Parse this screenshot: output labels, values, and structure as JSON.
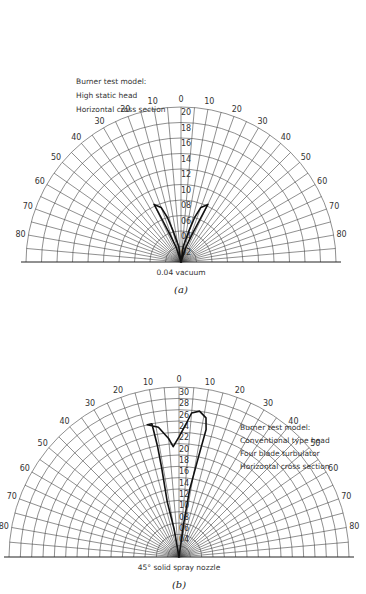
{
  "chart_data": [
    {
      "type": "polar",
      "panel": "(a)",
      "caption": "(a)",
      "annotation": [
        "Burner test model:",
        "High static head",
        "Horizontal cross section"
      ],
      "bottom_label": "0.04 vacuum",
      "angle_ticks_deg": [
        0,
        10,
        20,
        30,
        40,
        50,
        60,
        70,
        80
      ],
      "radial_ticks": [
        "0.2",
        "0.4",
        "0.6",
        "0.8",
        "1.0",
        "1.2",
        "1.4",
        "1.6",
        "1.8",
        "2.0"
      ],
      "rmax": 2.0,
      "series": [
        {
          "name": "left lobe",
          "points": [
            [
              0,
              0
            ],
            [
              -8,
              0.2
            ],
            [
              -14,
              0.4
            ],
            [
              -17,
              0.6
            ],
            [
              -20,
              0.75
            ],
            [
              -25,
              0.82
            ],
            [
              -24,
              0.6
            ],
            [
              -22,
              0.4
            ],
            [
              -18,
              0.2
            ],
            [
              0,
              0
            ]
          ]
        },
        {
          "name": "right lobe",
          "points": [
            [
              0,
              0
            ],
            [
              8,
              0.2
            ],
            [
              14,
              0.4
            ],
            [
              17,
              0.6
            ],
            [
              20,
              0.75
            ],
            [
              25,
              0.82
            ],
            [
              24,
              0.6
            ],
            [
              22,
              0.4
            ],
            [
              18,
              0.2
            ],
            [
              0,
              0
            ]
          ]
        }
      ]
    },
    {
      "type": "polar",
      "panel": "(b)",
      "caption": "(b)",
      "annotation": [
        "Burner test model:",
        "Conventional type head",
        "Four blade turbulator",
        "Horizontal cross section"
      ],
      "bottom_label": "45° solid spray nozzle",
      "angle_ticks_deg": [
        0,
        10,
        20,
        30,
        40,
        50,
        60,
        70,
        80
      ],
      "radial_ticks": [
        "0.4",
        "0.6",
        "0.8",
        "1.0",
        "1.2",
        "1.4",
        "1.6",
        "1.8",
        "2.0",
        "2.2",
        "2.4",
        "2.6",
        "2.8",
        "3.0"
      ],
      "rmax": 3.0,
      "series": [
        {
          "name": "spray pattern",
          "points": [
            [
              0,
              0
            ],
            [
              -10,
              0.5
            ],
            [
              -12,
              1.0
            ],
            [
              -11,
              1.6
            ],
            [
              -11,
              2.0
            ],
            [
              -11.5,
              2.4
            ],
            [
              -13.5,
              2.4
            ],
            [
              -9,
              2.32
            ],
            [
              -5,
              2.1
            ],
            [
              -3,
              1.95
            ],
            [
              0,
              2.12
            ],
            [
              3,
              2.35
            ],
            [
              5,
              2.55
            ],
            [
              8,
              2.6
            ],
            [
              11,
              2.5
            ],
            [
              12,
              2.3
            ],
            [
              11,
              1.8
            ],
            [
              9,
              1.2
            ],
            [
              8,
              0.6
            ],
            [
              0,
              0
            ]
          ]
        }
      ]
    }
  ]
}
